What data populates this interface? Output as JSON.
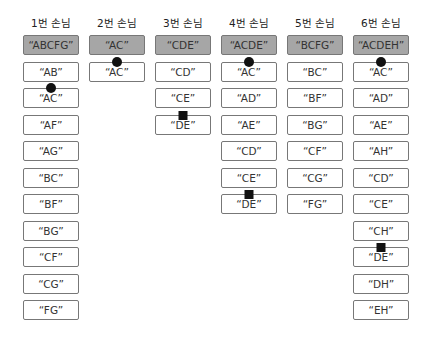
{
  "guests": [
    {
      "label": "1번 손님",
      "set": "“ABCFG”",
      "pairs": [
        {
          "t": "“AB”"
        },
        {
          "t": "“AC”",
          "m": "dot"
        },
        {
          "t": "“AF”"
        },
        {
          "t": "“AG”"
        },
        {
          "t": "“BC”"
        },
        {
          "t": "“BF”"
        },
        {
          "t": "“BG”"
        },
        {
          "t": "“CF”"
        },
        {
          "t": "“CG”"
        },
        {
          "t": "“FG”"
        }
      ]
    },
    {
      "label": "2번 손님",
      "set": "“AC”",
      "pairs": [
        {
          "t": "“AC”",
          "m": "dot"
        }
      ]
    },
    {
      "label": "3번 손님",
      "set": "“CDE”",
      "pairs": [
        {
          "t": "“CD”"
        },
        {
          "t": "“CE”"
        },
        {
          "t": "“DE”",
          "m": "sq"
        }
      ]
    },
    {
      "label": "4번 손님",
      "set": "“ACDE”",
      "pairs": [
        {
          "t": "“AC”",
          "m": "dot"
        },
        {
          "t": "“AD”"
        },
        {
          "t": "“AE”"
        },
        {
          "t": "“CD”"
        },
        {
          "t": "“CE”"
        },
        {
          "t": "“DE”",
          "m": "sq"
        }
      ]
    },
    {
      "label": "5번 손님",
      "set": "“BCFG”",
      "pairs": [
        {
          "t": "“BC”"
        },
        {
          "t": "“BF”"
        },
        {
          "t": "“BG”"
        },
        {
          "t": "“CF”"
        },
        {
          "t": "“CG”"
        },
        {
          "t": "“FG”"
        }
      ]
    },
    {
      "label": "6번 손님",
      "set": "“ACDEH”",
      "pairs": [
        {
          "t": "“AC”",
          "m": "dot"
        },
        {
          "t": "“AD”"
        },
        {
          "t": "“AE”"
        },
        {
          "t": "“AH”"
        },
        {
          "t": "“CD”"
        },
        {
          "t": "“CE”"
        },
        {
          "t": "“CH”"
        },
        {
          "t": "“DE”",
          "m": "sq"
        },
        {
          "t": "“DH”"
        },
        {
          "t": "“EH”"
        }
      ]
    }
  ],
  "legend": {
    "dot": "circle-marker",
    "sq": "square-marker"
  }
}
